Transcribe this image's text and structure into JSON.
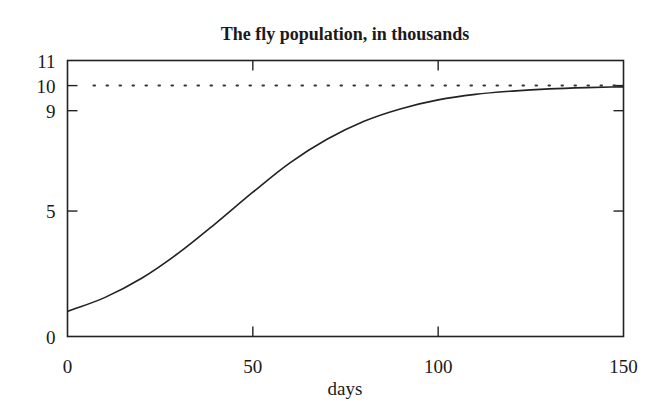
{
  "chart_data": {
    "type": "line",
    "title": "The fly population, in thousands",
    "xlabel": "days",
    "ylabel": "",
    "xlim": [
      0,
      150
    ],
    "ylim": [
      0,
      11
    ],
    "xticks": [
      0,
      50,
      100,
      150
    ],
    "yticks": [
      0,
      5,
      9,
      10,
      11
    ],
    "grid": false,
    "legend": null,
    "series": [
      {
        "name": "fly population (logistic, K=10, P0=1, r=0.05)",
        "style": "solid",
        "x": [
          0,
          10,
          20,
          30,
          40,
          50,
          60,
          70,
          80,
          90,
          100,
          110,
          120,
          130,
          140,
          150
        ],
        "values": [
          1.0,
          1.55,
          2.32,
          3.33,
          4.51,
          5.75,
          6.92,
          7.86,
          8.58,
          9.08,
          9.43,
          9.65,
          9.78,
          9.87,
          9.92,
          9.95
        ]
      },
      {
        "name": "carrying capacity",
        "style": "dotted",
        "x": [
          0,
          150
        ],
        "values": [
          10,
          10
        ]
      }
    ]
  },
  "labels": {
    "title": "The fly population, in thousands",
    "xlabel": "days",
    "xtick_labels": [
      "0",
      "50",
      "100",
      "150"
    ],
    "ytick_labels": [
      "0",
      "5",
      "9",
      "10",
      "11"
    ]
  }
}
